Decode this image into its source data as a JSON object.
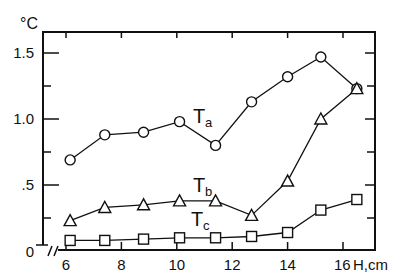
{
  "chart_data": {
    "type": "line",
    "title": "",
    "xlabel": "H,cm",
    "ylabel": "°C",
    "xlim": [
      5.4,
      17.7
    ],
    "ylim": [
      0,
      1.6
    ],
    "x_ticks": [
      "6",
      "8",
      "10",
      "12",
      "14",
      "16"
    ],
    "y_ticks": [
      "0",
      ".5",
      "1.0",
      "1.5"
    ],
    "grid": false,
    "x": [
      6.15,
      7.4,
      8.8,
      10.1,
      11.4,
      12.7,
      14.0,
      15.2,
      16.5
    ],
    "series": [
      {
        "name": "Ta",
        "marker": "circle",
        "values": [
          0.69,
          0.88,
          0.9,
          0.98,
          0.8,
          1.13,
          1.32,
          1.47,
          1.23
        ]
      },
      {
        "name": "Tb",
        "marker": "triangle",
        "values": [
          0.23,
          0.33,
          0.35,
          0.38,
          0.38,
          0.27,
          0.53,
          1.0,
          1.23
        ]
      },
      {
        "name": "Tc",
        "marker": "square",
        "values": [
          0.08,
          0.08,
          0.09,
          0.1,
          0.1,
          0.11,
          0.14,
          0.31,
          0.39
        ]
      }
    ],
    "labels": {
      "Ta": "T",
      "Ta_sub": "a",
      "Tb": "T",
      "Tb_sub": "b",
      "Tc": "T",
      "Tc_sub": "c"
    }
  }
}
